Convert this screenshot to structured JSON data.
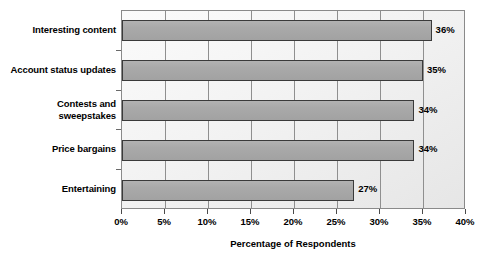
{
  "chart_data": {
    "type": "bar",
    "orientation": "horizontal",
    "title": "",
    "subtitle": "",
    "xlabel": "Percentage of Respondents",
    "ylabel": "",
    "categories": [
      "Interesting content",
      "Account status updates",
      "Contests and sweepstakes",
      "Price bargains",
      "Entertaining"
    ],
    "values": [
      36,
      35,
      34,
      34,
      27
    ],
    "value_labels": [
      "36%",
      "35%",
      "34%",
      "34%",
      "27%"
    ],
    "xlim": [
      0,
      40
    ],
    "xticks": [
      0,
      5,
      10,
      15,
      20,
      25,
      30,
      35,
      40
    ],
    "xtick_labels": [
      "0%",
      "5%",
      "10%",
      "15%",
      "20%",
      "25%",
      "30%",
      "35%",
      "40%"
    ],
    "grid": "vertical",
    "legend": "none",
    "bar_color": "#a9a9a9",
    "bar_border_color": "#3a3a3a",
    "plot_border_color": "#8a8a8a",
    "gridline_color": "#8f8f8f",
    "text_color": "#000000"
  }
}
